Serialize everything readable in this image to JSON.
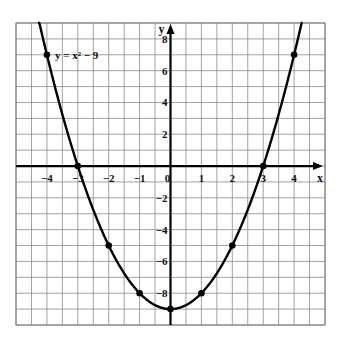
{
  "chart_data": {
    "type": "line",
    "title": "",
    "equation_label": "y = x² − 9",
    "xlabel": "x",
    "ylabel": "y",
    "xlim": [
      -5,
      5
    ],
    "ylim": [
      -10,
      9
    ],
    "grid": true,
    "grid_step_x": 0.5,
    "grid_step_y": 1,
    "x_ticks": [
      -4,
      -3,
      -2,
      -1,
      0,
      1,
      2,
      3,
      4
    ],
    "x_tick_labels": [
      "−4",
      "−3",
      "−2",
      "−1",
      "0",
      "1",
      "2",
      "3",
      "4"
    ],
    "y_ticks": [
      8,
      6,
      4,
      2,
      -2,
      -4,
      -6,
      -8
    ],
    "y_tick_labels": [
      "8",
      "6",
      "4",
      "2",
      "−2",
      "−4",
      "−6",
      "−8"
    ],
    "series": [
      {
        "name": "y = x² − 9",
        "function": "x^2 - 9",
        "x": [
          -4,
          -3,
          -2,
          -1,
          0,
          1,
          2,
          3,
          4
        ],
        "y": [
          7,
          0,
          -5,
          -8,
          -9,
          -8,
          -5,
          0,
          7
        ],
        "marked_points": true
      }
    ],
    "colors": {
      "curve": "#000000",
      "grid": "#8a8a8a",
      "axis": "#000000"
    }
  }
}
